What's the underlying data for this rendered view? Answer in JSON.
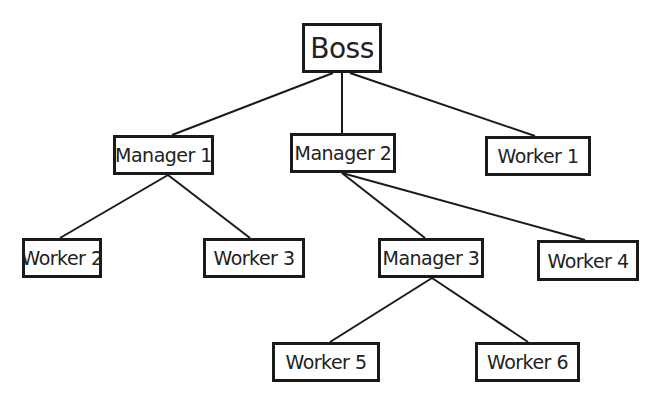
{
  "diagram": {
    "type": "tree",
    "colors": {
      "line": "#1a1a1a",
      "box_border": "#1a1a1a",
      "text": "#222222",
      "background": "#ffffff"
    },
    "nodes": [
      {
        "id": "boss",
        "label": "Boss",
        "x": 302,
        "y": 23,
        "w": 80,
        "h": 50
      },
      {
        "id": "manager1",
        "label": "Manager 1",
        "x": 113,
        "y": 135,
        "w": 101,
        "h": 40
      },
      {
        "id": "manager2",
        "label": "Manager 2",
        "x": 290,
        "y": 133,
        "w": 106,
        "h": 40
      },
      {
        "id": "worker1",
        "label": "Worker 1",
        "x": 485,
        "y": 136,
        "w": 106,
        "h": 40
      },
      {
        "id": "worker2",
        "label": "Worker 2",
        "x": 22,
        "y": 238,
        "w": 80,
        "h": 40
      },
      {
        "id": "worker3",
        "label": "Worker 3",
        "x": 203,
        "y": 238,
        "w": 102,
        "h": 40
      },
      {
        "id": "manager3",
        "label": "Manager 3",
        "x": 378,
        "y": 238,
        "w": 106,
        "h": 40
      },
      {
        "id": "worker4",
        "label": "Worker 4",
        "x": 537,
        "y": 240,
        "w": 102,
        "h": 41
      },
      {
        "id": "worker5",
        "label": "Worker 5",
        "x": 272,
        "y": 342,
        "w": 108,
        "h": 40
      },
      {
        "id": "worker6",
        "label": "Worker 6",
        "x": 475,
        "y": 342,
        "w": 105,
        "h": 40
      }
    ],
    "edges": [
      {
        "from": "boss",
        "to": "manager1",
        "x1": 333,
        "y1": 73,
        "x2": 172,
        "y2": 135
      },
      {
        "from": "boss",
        "to": "manager2",
        "x1": 342,
        "y1": 73,
        "x2": 342,
        "y2": 133
      },
      {
        "from": "boss",
        "to": "worker1",
        "x1": 350,
        "y1": 73,
        "x2": 535,
        "y2": 136
      },
      {
        "from": "manager1",
        "to": "worker2",
        "x1": 168,
        "y1": 175,
        "x2": 60,
        "y2": 238
      },
      {
        "from": "manager1",
        "to": "worker3",
        "x1": 168,
        "y1": 175,
        "x2": 250,
        "y2": 238
      },
      {
        "from": "manager2",
        "to": "manager3",
        "x1": 342,
        "y1": 173,
        "x2": 425,
        "y2": 238
      },
      {
        "from": "manager2",
        "to": "worker4",
        "x1": 342,
        "y1": 173,
        "x2": 585,
        "y2": 240
      },
      {
        "from": "manager3",
        "to": "worker5",
        "x1": 432,
        "y1": 278,
        "x2": 330,
        "y2": 342
      },
      {
        "from": "manager3",
        "to": "worker6",
        "x1": 432,
        "y1": 278,
        "x2": 528,
        "y2": 342
      }
    ]
  }
}
